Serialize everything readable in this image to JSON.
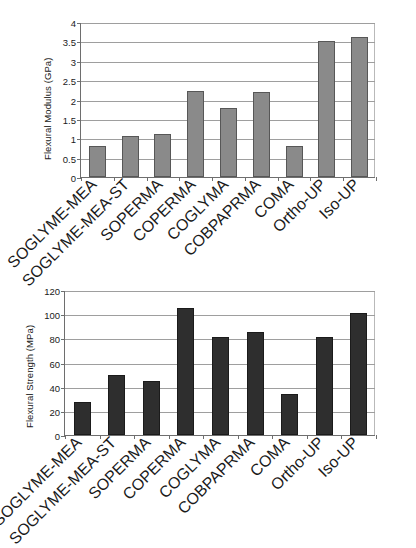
{
  "figure": {
    "background": "#ffffff",
    "charts": [
      {
        "id": "flexural-modulus",
        "bar_color": "#8a8a8a"
      },
      {
        "id": "flexural-strength",
        "bar_color": "#2e2e2e"
      }
    ]
  },
  "chart_data": [
    {
      "type": "bar",
      "title": "",
      "xlabel": "",
      "ylabel": "Flexural Modulus (GPa)",
      "ylim": [
        0,
        4
      ],
      "yticks": [
        0,
        0.5,
        1,
        1.5,
        2,
        2.5,
        3,
        3.5,
        4
      ],
      "ytick_labels": [
        "0",
        "0.5",
        "1",
        "1.5",
        "2",
        "2.5",
        "3",
        "3.5",
        "4"
      ],
      "grid": true,
      "legend": "none",
      "categories": [
        "SOGLYME-MEA",
        "SOGLYME-MEA-ST",
        "SOPERMA",
        "COPERMA",
        "COGLYMA",
        "COBPAPRMA",
        "COMA",
        "Ortho-UP",
        "Iso-UP"
      ],
      "values": [
        0.8,
        1.06,
        1.12,
        2.23,
        1.79,
        2.2,
        0.81,
        3.5,
        3.62
      ]
    },
    {
      "type": "bar",
      "title": "",
      "xlabel": "",
      "ylabel": "Flexural Strength (MPa)",
      "ylim": [
        0,
        120
      ],
      "yticks": [
        0,
        20,
        40,
        60,
        80,
        100,
        120
      ],
      "ytick_labels": [
        "0",
        "20",
        "40",
        "60",
        "80",
        "100",
        "120"
      ],
      "grid": true,
      "legend": "none",
      "categories": [
        "SOGLYME-MEA",
        "SOGLYME-MEA-ST",
        "SOPERMA",
        "COPERMA",
        "COGLYMA",
        "COBPAPRMA",
        "COMA",
        "Ortho-UP",
        "Iso-UP"
      ],
      "values": [
        27,
        50,
        45,
        105,
        81,
        85,
        34,
        81.5,
        101
      ]
    }
  ]
}
